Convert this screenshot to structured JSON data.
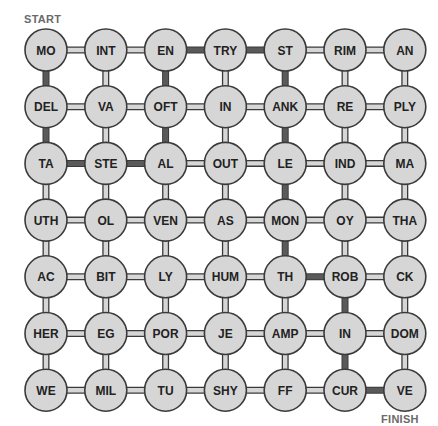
{
  "labels": {
    "start": "START",
    "finish": "FINISH",
    "title_partial": ""
  },
  "grid": {
    "cols": 7,
    "rows": 7,
    "origin": [
      46,
      50
    ],
    "spacing": [
      59.8,
      56.7
    ],
    "radius": 21,
    "cells": [
      [
        "MO",
        "INT",
        "EN",
        "TRY",
        "ST",
        "RIM",
        "AN"
      ],
      [
        "DEL",
        "VA",
        "OFT",
        "IN",
        "ANK",
        "RE",
        "PLY"
      ],
      [
        "TA",
        "STE",
        "AL",
        "OUT",
        "LE",
        "IND",
        "MA"
      ],
      [
        "UTH",
        "OL",
        "VEN",
        "AS",
        "MON",
        "OY",
        "THA"
      ],
      [
        "AC",
        "BIT",
        "LY",
        "HUM",
        "TH",
        "ROB",
        "CK"
      ],
      [
        "HER",
        "EG",
        "POR",
        "JE",
        "AMP",
        "IN",
        "DOM"
      ],
      [
        "WE",
        "MIL",
        "TU",
        "SHY",
        "FF",
        "CUR",
        "VE"
      ]
    ]
  },
  "solution_path": [
    [
      0,
      0
    ],
    [
      1,
      0
    ],
    [
      2,
      0
    ],
    [
      2,
      1
    ],
    [
      2,
      2
    ],
    [
      1,
      2
    ],
    [
      0,
      2
    ],
    [
      0,
      3
    ],
    [
      0,
      4
    ],
    [
      1,
      4
    ],
    [
      2,
      4
    ],
    [
      3,
      4
    ],
    [
      4,
      4
    ],
    [
      4,
      5
    ],
    [
      5,
      5
    ],
    [
      6,
      5
    ],
    [
      6,
      6
    ]
  ],
  "solution_words": [
    "MODEL",
    "TASTE",
    "ALOFTEN",
    "ENTRY",
    "STANKLE",
    "MONTH",
    "ROBIN",
    "CURVE"
  ],
  "colors": {
    "node_fill": "#d6d6d6",
    "outline": "#3a3a3a",
    "path": "#5a5a5a",
    "label": "#6a6a6a"
  }
}
